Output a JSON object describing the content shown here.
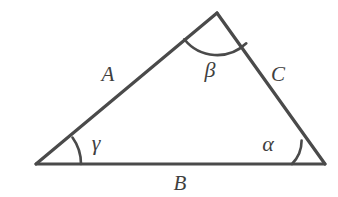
{
  "figure": {
    "type": "geometry-diagram",
    "shape": "triangle",
    "background_color": "#ffffff",
    "stroke_color": "#4a4a4a",
    "label_color": "#3f3f3f",
    "vertices": {
      "left": {
        "name": "gamma-vertex",
        "x": 36,
        "y": 164
      },
      "apex": {
        "name": "beta-vertex",
        "x": 217,
        "y": 13
      },
      "right": {
        "name": "alpha-vertex",
        "x": 325,
        "y": 164
      }
    },
    "sides": [
      {
        "id": "a",
        "label": "A",
        "from": "left",
        "to": "apex",
        "label_x": 108,
        "label_y": 74
      },
      {
        "id": "b",
        "label": "B",
        "from": "left",
        "to": "right",
        "label_x": 180,
        "label_y": 183
      },
      {
        "id": "c",
        "label": "C",
        "from": "apex",
        "to": "right",
        "label_x": 278,
        "label_y": 74
      }
    ],
    "angles": [
      {
        "id": "alpha",
        "label": "α",
        "vertex": "right",
        "arc_radius": 33,
        "label_x": 268,
        "label_y": 144
      },
      {
        "id": "beta",
        "label": "β",
        "vertex": "apex",
        "arc_radius": 42,
        "label_x": 210,
        "label_y": 70
      },
      {
        "id": "gamma",
        "label": "γ",
        "vertex": "left",
        "arc_radius": 45,
        "label_x": 96,
        "label_y": 143
      }
    ],
    "stroke_widths": {
      "triangle_side": 3.2,
      "base_side": 3.0,
      "angle_arc": 2.6
    }
  }
}
